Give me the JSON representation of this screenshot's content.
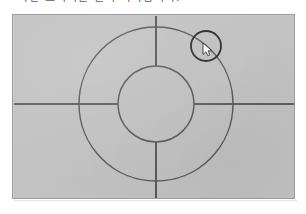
{
  "document": {
    "caption_line": "가면 표시되는 원이 나타납니다."
  },
  "figure": {
    "panel_label": "geometry-figure",
    "background_color": "#c3c3c3",
    "border_color": "#9d9d9d",
    "stroke_color": "#5a5a5a",
    "axis_color": "#3f3f3f",
    "center": {
      "x": 143,
      "y": 89
    },
    "outer_circle": {
      "cx": 143,
      "cy": 89,
      "r": 77,
      "label": "outer-circle"
    },
    "inner_circle": {
      "cx": 143,
      "cy": 89,
      "r": 38,
      "label": "inner-circle"
    },
    "selection_circle": {
      "cx": 193,
      "cy": 31,
      "r": 15,
      "label": "selection-circle"
    },
    "horizontal_axis": {
      "x1": 1,
      "y1": 89,
      "x2": 281,
      "y2": 89,
      "label": "horizontal-axis"
    },
    "vertical_axis": {
      "x1": 143,
      "y1": 1,
      "x2": 143,
      "y2": 183,
      "label": "vertical-axis"
    },
    "cursor": {
      "x": 190,
      "y": 28,
      "label": "mouse-cursor"
    }
  }
}
